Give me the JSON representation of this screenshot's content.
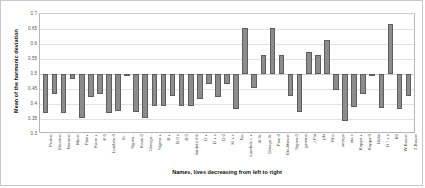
{
  "chart_data": {
    "type": "bar",
    "title": "",
    "xlabel": "Names, lives decreasing from left to right",
    "ylabel": "Mean of the harmonic deviation",
    "ylim": [
      0.3,
      0.7
    ],
    "yticks": [
      "0.7",
      "0.65",
      "0.6",
      "0.55",
      "0.5",
      "0.45",
      "0.4",
      "0.35",
      "0.3"
    ],
    "ytick_values": [
      0.7,
      0.65,
      0.6,
      0.55,
      0.5,
      0.45,
      0.4,
      0.35,
      0.3
    ],
    "grid": true,
    "legend": "none",
    "baseline": 0.5,
    "bar_color": "#8c8c8c",
    "bar_edge_color": "#5e5e5e",
    "categories": [
      "Proton",
      "Electron",
      "Neutron",
      "Muon",
      "Pion+",
      "Kaon +",
      "K 0",
      "Lambda 0",
      "Xi -",
      "Sigma -",
      "Kaon 0",
      "Omega -",
      "Sigma +",
      "B +",
      "B 0 s",
      "B 0",
      "lambda 0 b",
      "D +",
      "D + s",
      "D 0",
      "Xi + c",
      "Tau",
      "Lambda c +",
      "Xi 0c",
      "Omega 0c",
      "Pion 0",
      "Eta-Meson",
      "Sigma 0",
      "gamma",
      "J-Psi",
      "phi",
      "Rho",
      "omega",
      "eta c",
      "Kappa +",
      "Kappa 0",
      "Delta",
      "D * + s",
      "K0",
      "W-Boson",
      "Z-Boson"
    ],
    "values": [
      0.37,
      0.435,
      0.37,
      0.485,
      0.355,
      0.425,
      0.432,
      0.37,
      0.378,
      0.501,
      0.372,
      0.355,
      0.392,
      0.393,
      0.428,
      0.392,
      0.393,
      0.417,
      0.468,
      0.425,
      0.468,
      0.385,
      0.655,
      0.452,
      0.565,
      0.653,
      0.564,
      0.428,
      0.372,
      0.572,
      0.563,
      0.613,
      0.448,
      0.344,
      0.39,
      0.432,
      0.501,
      0.386,
      0.666,
      0.385,
      0.428
    ]
  }
}
